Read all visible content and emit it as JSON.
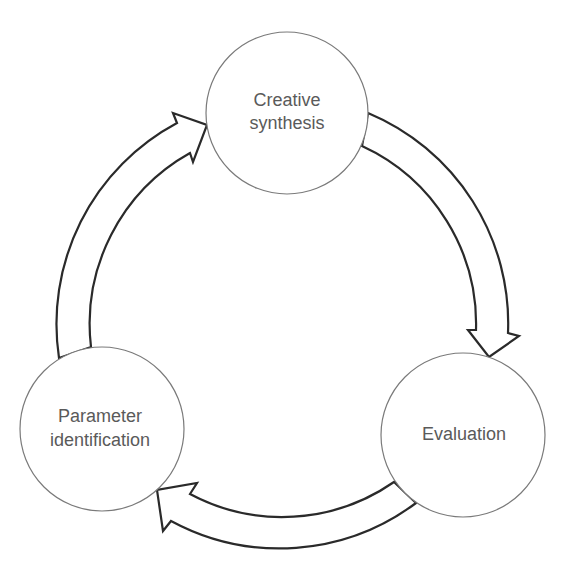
{
  "diagram": {
    "type": "cycle",
    "nodes": [
      {
        "id": "creative-synthesis",
        "lines": [
          "Creative",
          "synthesis"
        ]
      },
      {
        "id": "evaluation",
        "lines": [
          "Evaluation"
        ]
      },
      {
        "id": "parameter-identification",
        "lines": [
          "Parameter",
          "identification"
        ]
      }
    ],
    "edges": [
      {
        "from": "creative-synthesis",
        "to": "evaluation",
        "direction": "clockwise"
      },
      {
        "from": "evaluation",
        "to": "parameter-identification",
        "direction": "clockwise"
      },
      {
        "from": "parameter-identification",
        "to": "creative-synthesis",
        "direction": "clockwise"
      }
    ],
    "colors": {
      "background": "#ffffff",
      "circle_stroke": "#7a7a7a",
      "arrow_stroke": "#2a2a2a",
      "text": "#5a5a5a"
    }
  }
}
